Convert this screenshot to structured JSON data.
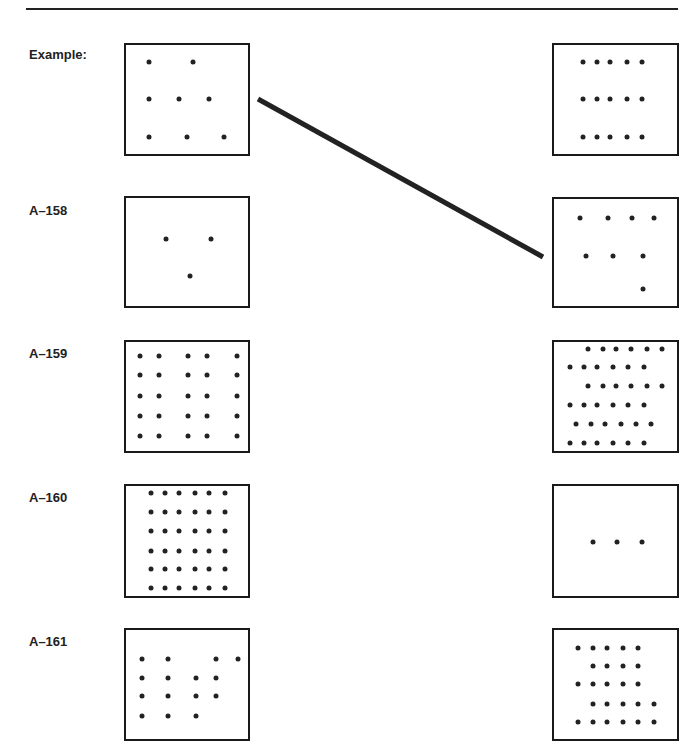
{
  "page": {
    "items": [
      {
        "label": "Example:",
        "label_top": 47,
        "left_box": {
          "x": 124,
          "y": 43,
          "w": 126,
          "h": 113,
          "dot_count": 8,
          "dots": [
            [
              25,
              19
            ],
            [
              69,
              19
            ],
            [
              25,
              56
            ],
            [
              55,
              56
            ],
            [
              85,
              56
            ],
            [
              25,
              94
            ],
            [
              63,
              94
            ],
            [
              100,
              94
            ]
          ]
        },
        "right_box": {
          "x": 552,
          "y": 43,
          "w": 127,
          "h": 113,
          "dot_count": 15,
          "dots": [
            [
              31,
              19
            ],
            [
              45,
              19
            ],
            [
              58,
              19
            ],
            [
              75,
              19
            ],
            [
              90,
              19
            ],
            [
              31,
              56
            ],
            [
              45,
              56
            ],
            [
              58,
              56
            ],
            [
              75,
              56
            ],
            [
              90,
              56
            ],
            [
              31,
              94
            ],
            [
              45,
              94
            ],
            [
              58,
              94
            ],
            [
              75,
              94
            ],
            [
              90,
              94
            ]
          ]
        }
      },
      {
        "label": "A–158",
        "label_top": 203,
        "left_box": {
          "x": 124,
          "y": 196,
          "w": 126,
          "h": 112,
          "dot_count": 3,
          "dots": [
            [
              42,
              43
            ],
            [
              87,
              43
            ],
            [
              66,
              80
            ]
          ]
        },
        "right_box": {
          "x": 552,
          "y": 197,
          "w": 127,
          "h": 111,
          "dot_count": 8,
          "dots": [
            [
              28,
              21
            ],
            [
              56,
              21
            ],
            [
              80,
              21
            ],
            [
              102,
              21
            ],
            [
              34,
              59
            ],
            [
              61,
              59
            ],
            [
              91,
              59
            ],
            [
              91,
              92
            ]
          ]
        }
      },
      {
        "label": "A–159",
        "label_top": 346,
        "left_box": {
          "x": 124,
          "y": 340,
          "w": 126,
          "h": 113,
          "dot_count": 25,
          "dots": [
            [
              16,
              16
            ],
            [
              35,
              16
            ],
            [
              64,
              16
            ],
            [
              83,
              16
            ],
            [
              113,
              16
            ],
            [
              16,
              35
            ],
            [
              35,
              35
            ],
            [
              64,
              35
            ],
            [
              83,
              35
            ],
            [
              113,
              35
            ],
            [
              16,
              56
            ],
            [
              35,
              56
            ],
            [
              64,
              56
            ],
            [
              83,
              56
            ],
            [
              113,
              56
            ],
            [
              16,
              76
            ],
            [
              35,
              76
            ],
            [
              64,
              76
            ],
            [
              83,
              76
            ],
            [
              113,
              76
            ],
            [
              16,
              96
            ],
            [
              35,
              96
            ],
            [
              64,
              96
            ],
            [
              83,
              96
            ],
            [
              113,
              96
            ]
          ]
        },
        "right_box": {
          "x": 552,
          "y": 340,
          "w": 127,
          "h": 113,
          "dot_count": 36,
          "dots": [
            [
              36,
              9
            ],
            [
              51,
              9
            ],
            [
              64,
              9
            ],
            [
              79,
              9
            ],
            [
              95,
              9
            ],
            [
              110,
              9
            ],
            [
              18,
              27
            ],
            [
              32,
              27
            ],
            [
              45,
              27
            ],
            [
              61,
              27
            ],
            [
              76,
              27
            ],
            [
              92,
              27
            ],
            [
              36,
              46
            ],
            [
              51,
              46
            ],
            [
              64,
              46
            ],
            [
              79,
              46
            ],
            [
              95,
              46
            ],
            [
              110,
              46
            ],
            [
              18,
              65
            ],
            [
              32,
              65
            ],
            [
              45,
              65
            ],
            [
              61,
              65
            ],
            [
              76,
              65
            ],
            [
              92,
              65
            ],
            [
              24,
              84
            ],
            [
              39,
              84
            ],
            [
              53,
              84
            ],
            [
              69,
              84
            ],
            [
              84,
              84
            ],
            [
              99,
              84
            ],
            [
              18,
              103
            ],
            [
              32,
              103
            ],
            [
              45,
              103
            ],
            [
              61,
              103
            ],
            [
              76,
              103
            ],
            [
              92,
              103
            ]
          ]
        }
      },
      {
        "label": "A–160",
        "label_top": 490,
        "left_box": {
          "x": 124,
          "y": 484,
          "w": 126,
          "h": 114,
          "dot_count": 36,
          "dots": [
            [
              27,
              9
            ],
            [
              41,
              9
            ],
            [
              55,
              9
            ],
            [
              71,
              9
            ],
            [
              85,
              9
            ],
            [
              101,
              9
            ],
            [
              27,
              28
            ],
            [
              41,
              28
            ],
            [
              55,
              28
            ],
            [
              71,
              28
            ],
            [
              85,
              28
            ],
            [
              101,
              28
            ],
            [
              27,
              47
            ],
            [
              41,
              47
            ],
            [
              55,
              47
            ],
            [
              71,
              47
            ],
            [
              85,
              47
            ],
            [
              101,
              47
            ],
            [
              27,
              67
            ],
            [
              41,
              67
            ],
            [
              55,
              67
            ],
            [
              71,
              67
            ],
            [
              85,
              67
            ],
            [
              101,
              67
            ],
            [
              27,
              85
            ],
            [
              41,
              85
            ],
            [
              55,
              85
            ],
            [
              71,
              85
            ],
            [
              85,
              85
            ],
            [
              101,
              85
            ],
            [
              27,
              104
            ],
            [
              41,
              104
            ],
            [
              55,
              104
            ],
            [
              71,
              104
            ],
            [
              85,
              104
            ],
            [
              101,
              104
            ]
          ]
        },
        "right_box": {
          "x": 552,
          "y": 484,
          "w": 127,
          "h": 114,
          "dot_count": 3,
          "dots": [
            [
              41,
              58
            ],
            [
              65,
              58
            ],
            [
              90,
              58
            ]
          ]
        }
      },
      {
        "label": "A–161",
        "label_top": 634,
        "left_box": {
          "x": 124,
          "y": 628,
          "w": 126,
          "h": 113,
          "dot_count": 15,
          "dots": [
            [
              18,
              31
            ],
            [
              44,
              31
            ],
            [
              92,
              31
            ],
            [
              114,
              31
            ],
            [
              18,
              50
            ],
            [
              44,
              50
            ],
            [
              72,
              50
            ],
            [
              92,
              50
            ],
            [
              18,
              68
            ],
            [
              44,
              68
            ],
            [
              72,
              68
            ],
            [
              92,
              68
            ],
            [
              18,
              88
            ],
            [
              44,
              88
            ],
            [
              72,
              88
            ]
          ]
        },
        "right_box": {
          "x": 552,
          "y": 628,
          "w": 127,
          "h": 113,
          "dot_count": 25,
          "dots": [
            [
              26,
              20
            ],
            [
              41,
              20
            ],
            [
              55,
              20
            ],
            [
              71,
              20
            ],
            [
              86,
              20
            ],
            [
              41,
              38
            ],
            [
              55,
              38
            ],
            [
              71,
              38
            ],
            [
              86,
              38
            ],
            [
              26,
              56
            ],
            [
              41,
              56
            ],
            [
              55,
              56
            ],
            [
              71,
              56
            ],
            [
              86,
              56
            ],
            [
              41,
              76
            ],
            [
              55,
              76
            ],
            [
              71,
              76
            ],
            [
              86,
              76
            ],
            [
              102,
              76
            ],
            [
              26,
              94
            ],
            [
              41,
              94
            ],
            [
              55,
              94
            ],
            [
              71,
              94
            ],
            [
              86,
              94
            ],
            [
              102,
              94
            ]
          ]
        }
      }
    ],
    "connector": {
      "from": [
        258,
        99
      ],
      "to": [
        543,
        257
      ],
      "stroke": "#222222",
      "width": 5
    }
  }
}
